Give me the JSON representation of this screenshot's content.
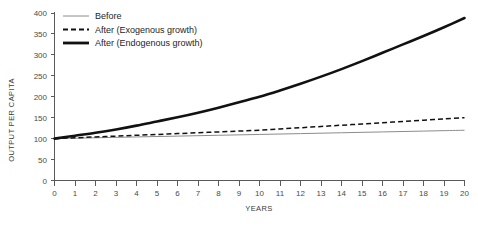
{
  "chart_data": {
    "type": "line",
    "title": "",
    "subtitle": "",
    "xlabel": "YEARS",
    "ylabel": "OUTPUT PER CAPITA",
    "xlim": [
      0,
      20
    ],
    "ylim": [
      0,
      400
    ],
    "grid": false,
    "legend_position": "top-left",
    "x": [
      0,
      1,
      2,
      3,
      4,
      5,
      6,
      7,
      8,
      9,
      10,
      11,
      12,
      13,
      14,
      15,
      16,
      17,
      18,
      19,
      20
    ],
    "xticks": [
      "0",
      "1",
      "2",
      "3",
      "4",
      "5",
      "6",
      "7",
      "8",
      "9",
      "10",
      "11",
      "12",
      "13",
      "14",
      "15",
      "16",
      "17",
      "18",
      "19",
      "20"
    ],
    "yticks": [
      "0",
      "50",
      "100",
      "150",
      "200",
      "250",
      "300",
      "350",
      "400"
    ],
    "ytick_values": [
      0,
      50,
      100,
      150,
      200,
      250,
      300,
      350,
      400
    ],
    "series": [
      {
        "name": "Before",
        "style": "thin-solid",
        "color": "#8c8c8c",
        "values": [
          100,
          101,
          102,
          103,
          104,
          105,
          106,
          107,
          108,
          109,
          110,
          111,
          112,
          113,
          114,
          115,
          116,
          117,
          118,
          119,
          120
        ]
      },
      {
        "name": "After (Exogenous growth)",
        "style": "dashed",
        "color": "#111111",
        "values": [
          100,
          102,
          104,
          106,
          108,
          110,
          112,
          114,
          116,
          118,
          120,
          123,
          126,
          129,
          132,
          135,
          138,
          141,
          144,
          147,
          150
        ]
      },
      {
        "name": "After (Endogenous growth)",
        "style": "thick-solid",
        "color": "#111111",
        "values": [
          100,
          107,
          114,
          122,
          131,
          141,
          151,
          162,
          174,
          187,
          200,
          215,
          231,
          248,
          266,
          285,
          305,
          325,
          345,
          366,
          388
        ]
      }
    ],
    "legend": [
      {
        "label": "Before",
        "style": "thin-solid"
      },
      {
        "label": "After (Exogenous growth)",
        "style": "dashed"
      },
      {
        "label": "After (Endogenous growth)",
        "style": "thick-solid"
      }
    ]
  }
}
